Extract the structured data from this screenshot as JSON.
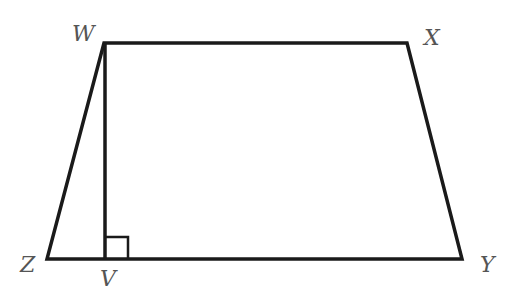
{
  "diagram": {
    "type": "trapezoid",
    "colors": {
      "stroke": "#1a1a1a",
      "label": "#555555",
      "background": "#ffffff"
    },
    "vertices": {
      "W": {
        "label": "W",
        "x": 104,
        "y": 43
      },
      "X": {
        "label": "X",
        "x": 407,
        "y": 43
      },
      "Y": {
        "label": "Y",
        "x": 462,
        "y": 259
      },
      "Z": {
        "label": "Z",
        "x": 47,
        "y": 259
      },
      "V": {
        "label": "V",
        "x": 105,
        "y": 259
      }
    },
    "segments": [
      "WX",
      "XY",
      "YZ",
      "ZW",
      "WV"
    ],
    "annotations": [
      {
        "type": "right-angle",
        "at": "V",
        "between": [
          "WV",
          "VY"
        ]
      }
    ]
  }
}
